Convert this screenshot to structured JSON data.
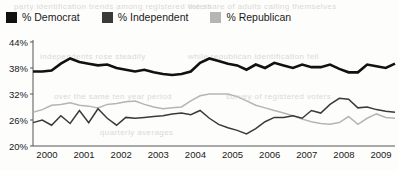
{
  "legend": {
    "items": [
      {
        "label": "% Democrat",
        "color": "#111111",
        "key": "democrat"
      },
      {
        "label": "% Independent",
        "color": "#3a3a3a",
        "key": "independent"
      },
      {
        "label": "% Republican",
        "color": "#b5b5b5",
        "key": "republican"
      }
    ]
  },
  "bleed_text": [
    {
      "text": "party identification trends among registered voters",
      "x": 14,
      "y": 2
    },
    {
      "text": "the share of adults calling themselves",
      "x": 188,
      "y": 2
    },
    {
      "text": "independents rose steadily",
      "x": 40,
      "y": 52
    },
    {
      "text": "while republican identification fell",
      "x": 188,
      "y": 52
    },
    {
      "text": "over the same ten year period",
      "x": 54,
      "y": 92
    },
    {
      "text": "survey of registered voters",
      "x": 226,
      "y": 92
    },
    {
      "text": "quarterly averages",
      "x": 100,
      "y": 128
    }
  ],
  "chart_data": {
    "type": "line",
    "title": "",
    "xlabel": "",
    "ylabel": "",
    "grid": false,
    "legend_position": "top",
    "ylim": [
      20,
      44
    ],
    "yticks": [
      "20%",
      "26%",
      "32%",
      "38%",
      "44%"
    ],
    "ytick_values": [
      20,
      26,
      32,
      38,
      44
    ],
    "xlim": [
      2000,
      2009.75
    ],
    "xticks": [
      "2000",
      "2001",
      "2002",
      "2003",
      "2004",
      "2005",
      "2006",
      "2007",
      "2008",
      "2009"
    ],
    "xtick_values": [
      2000,
      2001,
      2002,
      2003,
      2004,
      2005,
      2006,
      2007,
      2008,
      2009
    ],
    "x": [
      2000.0,
      2000.25,
      2000.5,
      2000.75,
      2001.0,
      2001.25,
      2001.5,
      2001.75,
      2002.0,
      2002.25,
      2002.5,
      2002.75,
      2003.0,
      2003.25,
      2003.5,
      2003.75,
      2004.0,
      2004.25,
      2004.5,
      2004.75,
      2005.0,
      2005.25,
      2005.5,
      2005.75,
      2006.0,
      2006.25,
      2006.5,
      2006.75,
      2007.0,
      2007.25,
      2007.5,
      2007.75,
      2008.0,
      2008.25,
      2008.5,
      2008.75,
      2009.0,
      2009.25,
      2009.5,
      2009.75
    ],
    "series": [
      {
        "name": "% Democrat",
        "color": "#111111",
        "width": 2.6,
        "values": [
          37.2,
          37.2,
          37.4,
          39.0,
          40.2,
          39.4,
          39.0,
          38.6,
          38.8,
          38.0,
          37.6,
          37.2,
          37.6,
          37.0,
          36.6,
          36.4,
          36.6,
          37.2,
          39.2,
          40.2,
          39.6,
          39.0,
          38.6,
          37.6,
          38.8,
          38.0,
          39.2,
          38.6,
          38.0,
          38.8,
          38.2,
          38.2,
          38.8,
          37.8,
          37.0,
          37.0,
          38.8,
          38.4,
          38.0,
          39.0
        ]
      },
      {
        "name": "% Independent",
        "color": "#3a3a3a",
        "width": 1.5,
        "values": [
          25.4,
          26.0,
          24.8,
          27.0,
          25.2,
          28.2,
          25.4,
          28.6,
          26.4,
          24.8,
          26.6,
          26.4,
          26.6,
          26.8,
          27.0,
          27.4,
          27.6,
          27.2,
          28.2,
          26.4,
          25.0,
          24.2,
          23.6,
          22.8,
          24.0,
          25.6,
          26.6,
          26.6,
          27.0,
          26.4,
          28.2,
          27.6,
          29.6,
          31.0,
          30.8,
          28.8,
          29.0,
          28.4,
          28.0,
          27.8
        ]
      },
      {
        "name": "% Republican",
        "color": "#b5b5b5",
        "width": 1.5,
        "values": [
          27.8,
          28.4,
          29.4,
          29.6,
          30.0,
          29.4,
          29.2,
          28.8,
          29.6,
          29.8,
          30.2,
          30.4,
          29.6,
          29.0,
          28.6,
          28.8,
          29.0,
          30.4,
          31.6,
          32.0,
          32.0,
          32.0,
          31.4,
          30.4,
          29.4,
          28.8,
          28.2,
          27.6,
          27.0,
          26.2,
          25.6,
          25.2,
          25.0,
          25.4,
          26.8,
          25.0,
          26.4,
          27.4,
          26.6,
          26.4
        ]
      }
    ]
  }
}
